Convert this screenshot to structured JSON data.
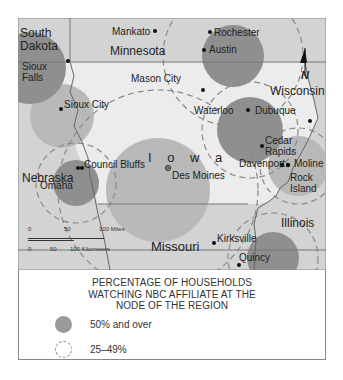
{
  "map": {
    "title": "NBC affiliate viewership regions around Iowa",
    "states": [
      {
        "name": "South Dakota",
        "lines": [
          "South",
          "Dakota"
        ]
      },
      {
        "name": "Minnesota",
        "lines": [
          "Minnesota"
        ]
      },
      {
        "name": "Wisconsin",
        "lines": [
          "Wisconsin"
        ]
      },
      {
        "name": "Iowa",
        "lines": [
          "I o w a"
        ]
      },
      {
        "name": "Nebraska",
        "lines": [
          "Nebraska"
        ]
      },
      {
        "name": "Illinois",
        "lines": [
          "Illinois"
        ]
      },
      {
        "name": "Missouri",
        "lines": [
          "Missouri"
        ]
      }
    ],
    "cities": [
      {
        "name": "Mankato"
      },
      {
        "name": "Rochester"
      },
      {
        "name": "Austin"
      },
      {
        "name": "Sioux Falls",
        "lines": [
          "Sioux",
          "Falls"
        ]
      },
      {
        "name": "Mason City"
      },
      {
        "name": "Sioux City"
      },
      {
        "name": "Waterloo"
      },
      {
        "name": "Dubuque"
      },
      {
        "name": "Cedar Rapids"
      },
      {
        "name": "Des Moines"
      },
      {
        "name": "Council Bluffs"
      },
      {
        "name": "Omaha"
      },
      {
        "name": "Davenport"
      },
      {
        "name": "Moline"
      },
      {
        "name": "Rock Island",
        "lines": [
          "Rock",
          "Island"
        ]
      },
      {
        "name": "Kirksville"
      },
      {
        "name": "Quincy"
      }
    ],
    "north_arrow": "N",
    "scale": {
      "miles": {
        "ticks": [
          "0",
          "50",
          "100 Miles"
        ]
      },
      "kilometers": {
        "ticks": [
          "0",
          "50",
          "100 Kilometers"
        ]
      }
    },
    "colors": {
      "background": "#d3d3d3",
      "iowa": "#ececec",
      "dark_region": "#8f8f8f",
      "light_region": "#b9b9b9",
      "dashed": "#8a8a8a"
    }
  },
  "legend": {
    "title_lines": [
      "PERCENTAGE OF HOUSEHOLDS",
      "WATCHING NBC AFFILIATE AT THE",
      "NODE OF THE REGION"
    ],
    "items": [
      {
        "label": "50%  and over",
        "style": "solid"
      },
      {
        "label": "25–49%",
        "style": "dashed"
      }
    ]
  }
}
